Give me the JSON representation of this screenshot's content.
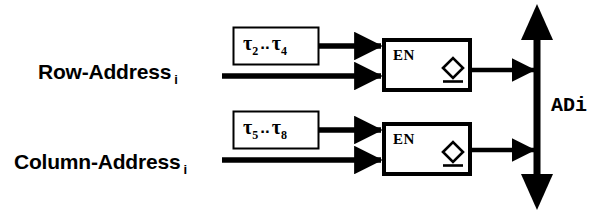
{
  "diagram": {
    "colors": {
      "ink": "#000000",
      "background": "#ffffff"
    },
    "inputs": [
      {
        "name": "row-address",
        "label": "Row-Address",
        "subscript": "i"
      },
      {
        "name": "column-address",
        "label": "Column-Address",
        "subscript": "i"
      }
    ],
    "tau_boxes": [
      {
        "name": "tau-box-upper",
        "symbol": "τ",
        "from_index": "2",
        "separator": "..",
        "to_index": "4"
      },
      {
        "name": "tau-box-lower",
        "symbol": "τ",
        "from_index": "5",
        "separator": "..",
        "to_index": "8"
      }
    ],
    "registers": [
      {
        "name": "register-upper",
        "enable_label": "EN",
        "clock_symbol": "diamond"
      },
      {
        "name": "register-lower",
        "enable_label": "EN",
        "clock_symbol": "diamond"
      }
    ],
    "bus": {
      "name": "address-bus",
      "label": "ADi",
      "direction": "bidirectional"
    }
  }
}
